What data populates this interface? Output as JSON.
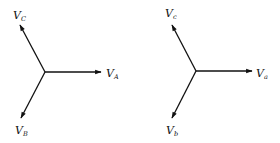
{
  "diagrams": [
    {
      "name": "uppercase-phasor-set",
      "center": [
        45,
        72
      ],
      "phasors": [
        {
          "label": "V",
          "sub": "A",
          "end": [
            101,
            72
          ],
          "label_pos": [
            106,
            77
          ]
        },
        {
          "label": "V",
          "sub": "C",
          "end": [
            20,
            25
          ],
          "label_pos": [
            13,
            19
          ]
        },
        {
          "label": "V",
          "sub": "B",
          "end": [
            21,
            118
          ],
          "label_pos": [
            15,
            134
          ]
        }
      ]
    },
    {
      "name": "lowercase-phasor-set",
      "center": [
        196,
        71
      ],
      "phasors": [
        {
          "label": "V",
          "sub": "a",
          "end": [
            252,
            71
          ],
          "label_pos": [
            256,
            77
          ]
        },
        {
          "label": "V",
          "sub": "c",
          "end": [
            172,
            25
          ],
          "label_pos": [
            165,
            17
          ]
        },
        {
          "label": "V",
          "sub": "b",
          "end": [
            172,
            118
          ],
          "label_pos": [
            166,
            134
          ]
        }
      ]
    }
  ],
  "colors": {
    "line": "#111111",
    "background": "#ffffff"
  }
}
